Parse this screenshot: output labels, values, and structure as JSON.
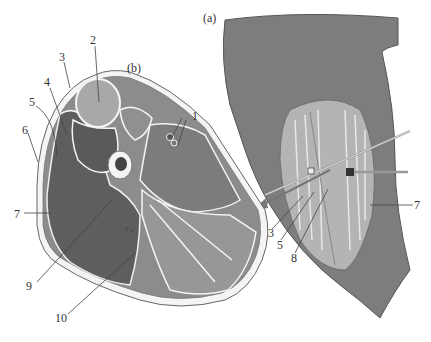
{
  "figure": {
    "panel_a": {
      "label": "(a)",
      "callouts": [
        {
          "id": "3",
          "text": "3"
        },
        {
          "id": "5",
          "text": "5"
        },
        {
          "id": "8",
          "text": "8"
        },
        {
          "id": "7",
          "text": "7"
        }
      ]
    },
    "panel_b": {
      "label": "(b)",
      "callouts": [
        {
          "id": "1",
          "text": "1"
        },
        {
          "id": "2",
          "text": "2"
        },
        {
          "id": "3",
          "text": "3"
        },
        {
          "id": "4",
          "text": "4"
        },
        {
          "id": "5",
          "text": "5"
        },
        {
          "id": "6",
          "text": "6"
        },
        {
          "id": "7",
          "text": "7"
        },
        {
          "id": "9",
          "text": "9"
        },
        {
          "id": "10",
          "text": "10"
        }
      ]
    }
  },
  "colors": {
    "skin": "#7d7d7d",
    "dark_muscle": "#5e5e5e",
    "mid_muscle": "#8a8a8a",
    "light_muscle": "#a8a8a8",
    "fascia": "#f4f4f4",
    "outline": "#555555",
    "leader": "#444444"
  }
}
